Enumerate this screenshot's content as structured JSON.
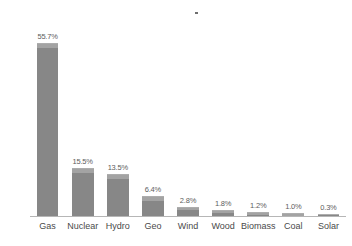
{
  "chart_data": {
    "type": "bar",
    "title": "",
    "subtitle": "",
    "xlabel": "",
    "ylabel": "",
    "ylim": [
      0,
      60
    ],
    "grid": false,
    "legend": false,
    "legend_position": "none",
    "orientation": "vertical",
    "bar_color": "#878787",
    "bar_highlight_color": "#a3a3a3",
    "label_color": "#5d5d5d",
    "axis_color": "#b6b6b6",
    "background_color": "#ffffff",
    "units": "percent",
    "categories": [
      "Gas",
      "Nuclear",
      "Hydro",
      "Geo",
      "Wind",
      "Wood",
      "Biomass",
      "Coal",
      "Solar"
    ],
    "values": [
      55.7,
      15.5,
      13.5,
      6.4,
      2.8,
      1.8,
      1.2,
      1.0,
      0.3
    ],
    "data_labels": [
      "55.7%",
      "15.5%",
      "13.5%",
      "6.4%",
      "2.8%",
      "1.8%",
      "1.2%",
      "1.0%",
      "0.3%"
    ],
    "annotations": []
  },
  "artifacts": {
    "speck_name": "scan-speck"
  }
}
